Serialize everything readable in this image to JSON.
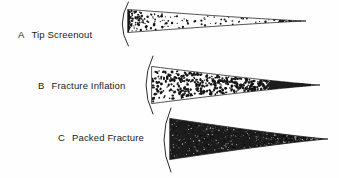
{
  "figure": {
    "background_color": "#fefefe",
    "ink_color": "#1a1a1a",
    "width": 339,
    "height": 178
  },
  "panels": [
    {
      "id": "a",
      "letter": "A",
      "label": "Tip Screenout",
      "label_full": "A  Tip Screenout",
      "proppant_style": "sparse-scattered",
      "proppant_description": "Discrete proppant grains, densely clustered near the wellbore and sparse toward the fracture tip",
      "wedge": {
        "mouth_x": 128,
        "tip_x": 306,
        "mid_y": 21,
        "mouth_top_y": 10,
        "mouth_bottom_y": 33
      },
      "wellbore": {
        "x": 124,
        "top_y": 2,
        "bottom_y": 46,
        "bulge": 8
      }
    },
    {
      "id": "b",
      "letter": "B",
      "label": "Fracture Inflation",
      "label_full": "B  Fracture Inflation",
      "proppant_style": "dense-scattered",
      "proppant_description": "Proppant grains filling the full fracture width with a solid packed tip",
      "wedge": {
        "mouth_x": 152,
        "tip_x": 320,
        "mid_y": 85,
        "mouth_top_y": 67,
        "mouth_bottom_y": 104
      },
      "wellbore": {
        "x": 148,
        "top_y": 56,
        "bottom_y": 114,
        "bulge": 9
      }
    },
    {
      "id": "c",
      "letter": "C",
      "label": "Packed Fracture",
      "label_full": "C  Packed Fracture",
      "proppant_style": "solid-packed",
      "proppant_description": "Fracture completely packed with proppant from wellbore to tip",
      "wedge": {
        "mouth_x": 170,
        "tip_x": 328,
        "mid_y": 139,
        "mouth_top_y": 119,
        "mouth_bottom_y": 160
      },
      "wellbore": {
        "x": 166,
        "top_y": 108,
        "bottom_y": 172,
        "bulge": 9
      }
    }
  ],
  "colors": {
    "proppant": "#161616",
    "outline": "#262626",
    "wellbore": "#2b2b2b",
    "text": "#1a1a1a"
  }
}
